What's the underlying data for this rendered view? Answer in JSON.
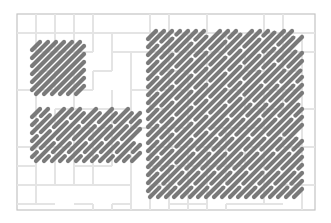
{
  "diagram": {
    "width": 331,
    "height": 223,
    "frame": {
      "x": 17,
      "y": 14,
      "w": 298,
      "h": 196,
      "stroke": "#c4c4c4"
    },
    "colors": {
      "stroke": "#7a7a7a",
      "outline": "#5e5e5e",
      "grid": "#e4e4e4",
      "background": "#ffffff"
    },
    "angle_deg": 45,
    "blocks": [
      {
        "name": "top-left-block",
        "x": 30,
        "y": 40,
        "w": 56,
        "h": 56,
        "spacing": 8,
        "dash": 0
      },
      {
        "name": "bottom-left-block",
        "x": 30,
        "y": 107,
        "w": 112,
        "h": 56,
        "spacing": 8,
        "dash": 26
      },
      {
        "name": "right-block",
        "x": 146,
        "y": 29,
        "w": 158,
        "h": 170,
        "spacing": 8,
        "dash": 30
      }
    ]
  }
}
